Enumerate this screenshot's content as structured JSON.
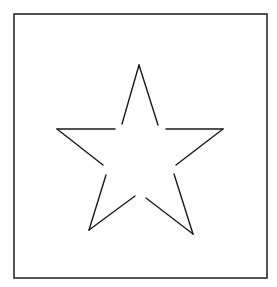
{
  "diagram": {
    "type": "star-outline",
    "stroke_color": "#1a1a1a",
    "frame_color": "#2a2a2a",
    "background": "#ffffff",
    "frame": {
      "x": 14,
      "y": 14,
      "width": 253,
      "height": 264
    },
    "star": {
      "points": {
        "top": [
          139,
          65
        ],
        "right": [
          223,
          129
        ],
        "bottom_right": [
          193,
          234
        ],
        "bottom_left": [
          89,
          230
        ],
        "left": [
          57,
          129
        ]
      },
      "segments": [
        {
          "name": "top-left-stroke",
          "from": [
            139,
            65
          ],
          "to": [
            122,
            124
          ]
        },
        {
          "name": "top-right-stroke",
          "from": [
            139,
            65
          ],
          "to": [
            158,
            125
          ]
        },
        {
          "name": "right-upper-stroke",
          "from": [
            223,
            129
          ],
          "to": [
            166,
            129
          ]
        },
        {
          "name": "right-lower-stroke",
          "from": [
            223,
            129
          ],
          "to": [
            176,
            165
          ]
        },
        {
          "name": "bottom-right-upper-stroke",
          "from": [
            193,
            234
          ],
          "to": [
            174,
            174
          ]
        },
        {
          "name": "bottom-right-inner-stroke",
          "from": [
            193,
            234
          ],
          "to": [
            146,
            198
          ]
        },
        {
          "name": "bottom-left-inner-stroke",
          "from": [
            89,
            230
          ],
          "to": [
            135,
            196
          ]
        },
        {
          "name": "bottom-left-upper-stroke",
          "from": [
            89,
            230
          ],
          "to": [
            106,
            175
          ]
        },
        {
          "name": "left-lower-stroke",
          "from": [
            57,
            129
          ],
          "to": [
            103,
            165
          ]
        },
        {
          "name": "left-upper-stroke",
          "from": [
            57,
            129
          ],
          "to": [
            115,
            129
          ]
        }
      ]
    }
  }
}
